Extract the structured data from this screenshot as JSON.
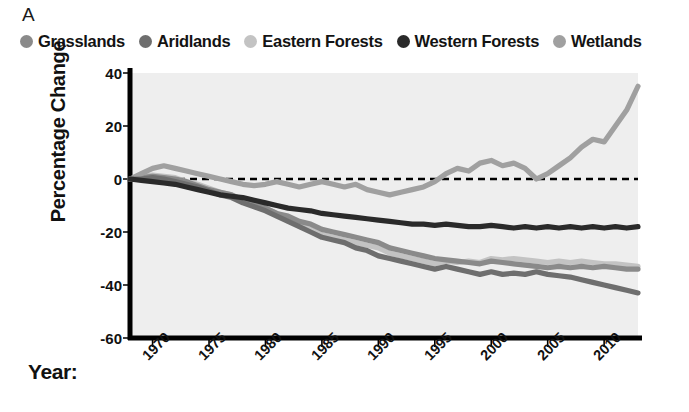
{
  "panel": {
    "label": "A"
  },
  "legend": {
    "items": [
      {
        "label": "Grasslands",
        "color": "#8a8a8a"
      },
      {
        "label": "Aridlands",
        "color": "#6e6e6e"
      },
      {
        "label": "Eastern Forests",
        "color": "#c3c3c3"
      },
      {
        "label": "Western Forests",
        "color": "#2a2a2a"
      },
      {
        "label": "Wetlands",
        "color": "#a0a0a0"
      }
    ]
  },
  "axes": {
    "ylabel": "Percentage Change",
    "xlabel": "Year:",
    "yticks": [
      40,
      20,
      0,
      -20,
      -40,
      -60
    ],
    "xticks": [
      1970,
      1975,
      1980,
      1985,
      1990,
      1995,
      2000,
      2005,
      2010
    ],
    "ylim": [
      -60,
      40
    ],
    "xlim": [
      1968,
      2013
    ],
    "zero_line": "dashed",
    "plot_bg": "#eeeeee",
    "axis_color": "#000000"
  },
  "chart_data": {
    "type": "line",
    "title": "",
    "xlabel": "Year",
    "ylabel": "Percentage Change",
    "ylim": [
      -60,
      40
    ],
    "xlim": [
      1968,
      2013
    ],
    "grid": false,
    "legend_position": "top",
    "annotations": [
      "dashed zero reference line at y = 0"
    ],
    "x": [
      1968,
      1969,
      1970,
      1971,
      1972,
      1973,
      1974,
      1975,
      1976,
      1977,
      1978,
      1979,
      1980,
      1981,
      1982,
      1983,
      1984,
      1985,
      1986,
      1987,
      1988,
      1989,
      1990,
      1991,
      1992,
      1993,
      1994,
      1995,
      1996,
      1997,
      1998,
      1999,
      2000,
      2001,
      2002,
      2003,
      2004,
      2005,
      2006,
      2007,
      2008,
      2009,
      2010,
      2011,
      2012,
      2013
    ],
    "series": [
      {
        "name": "Grasslands",
        "color": "#8a8a8a",
        "values": [
          0,
          0.5,
          1,
          0.5,
          0,
          -1,
          -2.5,
          -4,
          -5,
          -6,
          -8,
          -9,
          -11,
          -13,
          -14,
          -16,
          -17,
          -19,
          -20,
          -21,
          -22,
          -23,
          -24,
          -26,
          -27,
          -28,
          -29,
          -30,
          -30.5,
          -31,
          -31.5,
          -32,
          -31,
          -31.5,
          -32,
          -32.5,
          -33,
          -33.5,
          -33,
          -33.5,
          -33,
          -33.5,
          -33,
          -33.5,
          -34,
          -34
        ]
      },
      {
        "name": "Aridlands",
        "color": "#6e6e6e",
        "values": [
          0,
          0,
          0.5,
          0,
          -1,
          -2,
          -3,
          -4.5,
          -6,
          -7,
          -9,
          -10.5,
          -12,
          -14,
          -16,
          -18,
          -20,
          -22,
          -23,
          -24,
          -26,
          -27,
          -29,
          -30,
          -31,
          -32,
          -33,
          -34,
          -33,
          -34,
          -35,
          -36,
          -35,
          -36,
          -35.5,
          -36,
          -35,
          -36,
          -36.5,
          -37,
          -38,
          -39,
          -40,
          -41,
          -42,
          -43
        ]
      },
      {
        "name": "Eastern Forests",
        "color": "#c3c3c3",
        "values": [
          0,
          1,
          1.5,
          1,
          0.5,
          -1,
          -2,
          -3.5,
          -5,
          -6,
          -8,
          -9.5,
          -11,
          -13,
          -15,
          -17,
          -19,
          -21,
          -22,
          -23,
          -24,
          -25,
          -26,
          -28,
          -29,
          -30,
          -31,
          -32,
          -31,
          -31.5,
          -31,
          -31.5,
          -30,
          -30.5,
          -30,
          -30.5,
          -31,
          -31.5,
          -31,
          -31.5,
          -31,
          -31.5,
          -32,
          -32,
          -32.5,
          -33
        ]
      },
      {
        "name": "Western Forests",
        "color": "#2a2a2a",
        "values": [
          0,
          -0.5,
          -1,
          -1.5,
          -2,
          -3,
          -4,
          -5,
          -6,
          -6.5,
          -7,
          -8,
          -9,
          -10,
          -11,
          -11.5,
          -12,
          -13,
          -13.5,
          -14,
          -14.5,
          -15,
          -15.5,
          -16,
          -16.5,
          -17,
          -17,
          -17.5,
          -17,
          -17.5,
          -18,
          -18,
          -17.5,
          -18,
          -18.5,
          -18,
          -18.5,
          -18,
          -18.5,
          -18,
          -18.5,
          -18,
          -18.5,
          -18,
          -18.5,
          -18
        ]
      },
      {
        "name": "Wetlands",
        "color": "#a0a0a0",
        "values": [
          0,
          2,
          4,
          5,
          4,
          3,
          2,
          1,
          0,
          -1,
          -2,
          -2.5,
          -2,
          -1,
          -2,
          -3,
          -2,
          -1,
          -2,
          -3,
          -2,
          -4,
          -5,
          -6,
          -5,
          -4,
          -3,
          -1,
          2,
          4,
          3,
          6,
          7,
          5,
          6,
          4,
          0,
          2,
          5,
          8,
          12,
          15,
          14,
          20,
          26,
          35
        ]
      }
    ]
  }
}
